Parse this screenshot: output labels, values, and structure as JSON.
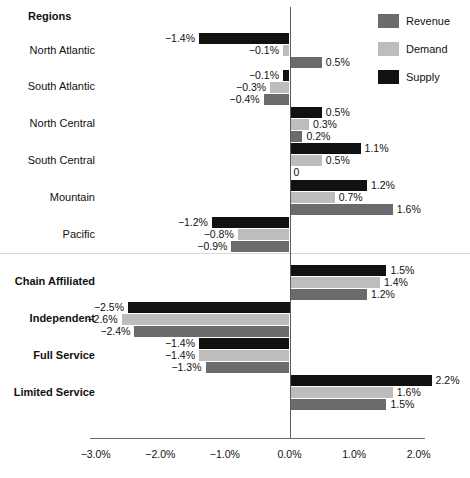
{
  "chart_data": {
    "type": "bar",
    "orientation": "horizontal",
    "title": "",
    "xlabel": "",
    "ylabel": "",
    "xlim": [
      -3.2,
      2.45
    ],
    "grid": false,
    "legend_position": "top-right",
    "value_suffix": "%",
    "xticks": [
      "−3.0%",
      "−2.0%",
      "−1.0%",
      "0.0%",
      "1.0%",
      "2.0%"
    ],
    "xtick_values": [
      -3.0,
      -2.0,
      -1.0,
      0.0,
      1.0,
      2.0
    ],
    "series": [
      {
        "name": "Revenue",
        "color": "#6b6b6b"
      },
      {
        "name": "Demand",
        "color": "#bdbdbd"
      },
      {
        "name": "Supply",
        "color": "#111111"
      }
    ],
    "series_draw_order": [
      "Supply",
      "Demand",
      "Revenue"
    ],
    "sections": [
      {
        "header": "Regions",
        "bold_labels": false,
        "categories": [
          {
            "label": "North Atlantic",
            "bars": [
              {
                "series": "Supply",
                "value": -1.4,
                "label": "−1.4%"
              },
              {
                "series": "Demand",
                "value": -0.1,
                "label": "−0.1%"
              },
              {
                "series": "Revenue",
                "value": 0.5,
                "label": "0.5%"
              }
            ]
          },
          {
            "label": "South Atlantic",
            "bars": [
              {
                "series": "Supply",
                "value": -0.1,
                "label": "−0.1%"
              },
              {
                "series": "Demand",
                "value": -0.3,
                "label": "−0.3%"
              },
              {
                "series": "Revenue",
                "value": -0.4,
                "label": "−0.4%"
              }
            ]
          },
          {
            "label": "North Central",
            "bars": [
              {
                "series": "Supply",
                "value": 0.5,
                "label": "0.5%"
              },
              {
                "series": "Demand",
                "value": 0.3,
                "label": "0.3%"
              },
              {
                "series": "Revenue",
                "value": 0.2,
                "label": "0.2%"
              }
            ]
          },
          {
            "label": "South Central",
            "bars": [
              {
                "series": "Supply",
                "value": 1.1,
                "label": "1.1%"
              },
              {
                "series": "Demand",
                "value": 0.5,
                "label": "0.5%"
              },
              {
                "series": "Revenue",
                "value": 0.0,
                "label": "0"
              }
            ]
          },
          {
            "label": "Mountain",
            "bars": [
              {
                "series": "Supply",
                "value": 1.2,
                "label": "1.2%"
              },
              {
                "series": "Demand",
                "value": 0.7,
                "label": "0.7%"
              },
              {
                "series": "Revenue",
                "value": 1.6,
                "label": "1.6%"
              }
            ]
          },
          {
            "label": "Pacific",
            "bars": [
              {
                "series": "Supply",
                "value": -1.2,
                "label": "−1.2%"
              },
              {
                "series": "Demand",
                "value": -0.8,
                "label": "−0.8%"
              },
              {
                "series": "Revenue",
                "value": -0.9,
                "label": "−0.9%"
              }
            ]
          }
        ]
      },
      {
        "header": "",
        "bold_labels": true,
        "categories": [
          {
            "label": "Chain Affiliated",
            "bars": [
              {
                "series": "Supply",
                "value": 1.5,
                "label": "1.5%"
              },
              {
                "series": "Demand",
                "value": 1.4,
                "label": "1.4%"
              },
              {
                "series": "Revenue",
                "value": 1.2,
                "label": "1.2%"
              }
            ]
          },
          {
            "label": "Independent",
            "bars": [
              {
                "series": "Supply",
                "value": -2.5,
                "label": "−2.5%"
              },
              {
                "series": "Demand",
                "value": -2.6,
                "label": "−2.6%"
              },
              {
                "series": "Revenue",
                "value": -2.4,
                "label": "−2.4%"
              }
            ]
          },
          {
            "label": "Full Service",
            "bars": [
              {
                "series": "Supply",
                "value": -1.4,
                "label": "−1.4%"
              },
              {
                "series": "Demand",
                "value": -1.4,
                "label": "−1.4%"
              },
              {
                "series": "Revenue",
                "value": -1.3,
                "label": "−1.3%"
              }
            ]
          },
          {
            "label": "Limited Service",
            "bars": [
              {
                "series": "Supply",
                "value": 2.2,
                "label": "2.2%"
              },
              {
                "series": "Demand",
                "value": 1.6,
                "label": "1.6%"
              },
              {
                "series": "Revenue",
                "value": 1.5,
                "label": "1.5%"
              }
            ]
          }
        ]
      }
    ]
  }
}
